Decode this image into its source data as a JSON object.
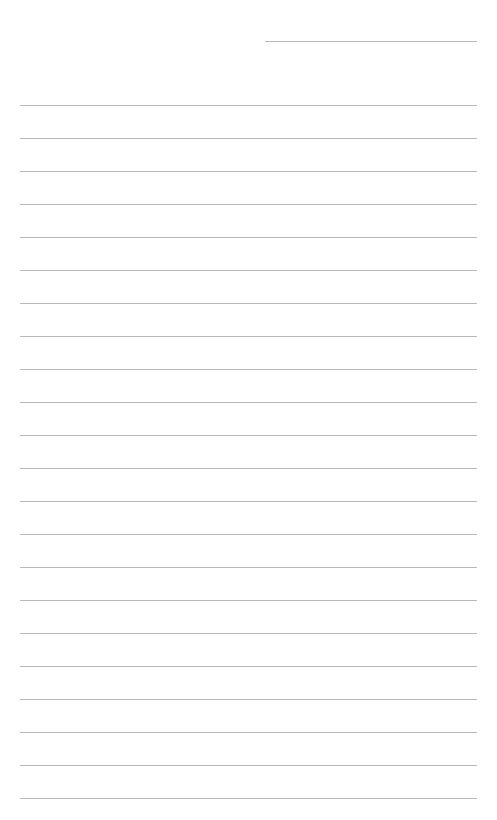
{
  "page": {
    "type": "lined-paper",
    "header_line": {
      "label": ""
    },
    "line_count": 22,
    "lines": [
      "",
      "",
      "",
      "",
      "",
      "",
      "",
      "",
      "",
      "",
      "",
      "",
      "",
      "",
      "",
      "",
      "",
      "",
      "",
      "",
      "",
      ""
    ],
    "line_color": "#b8b8b8",
    "background_color": "#ffffff"
  }
}
